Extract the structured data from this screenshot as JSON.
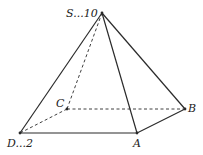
{
  "diagram": {
    "type": "square pyramid",
    "line_color": "#2a2a2a",
    "vertices": {
      "S": {
        "x": 102,
        "y": 13,
        "label": "S...10"
      },
      "A": {
        "x": 137,
        "y": 133,
        "label": "A"
      },
      "B": {
        "x": 185,
        "y": 109,
        "label": "B"
      },
      "C": {
        "x": 67,
        "y": 109,
        "label": "C"
      },
      "D": {
        "x": 20,
        "y": 133,
        "label": "D...2"
      }
    },
    "solid_edges": [
      [
        "S",
        "D"
      ],
      [
        "S",
        "A"
      ],
      [
        "S",
        "B"
      ],
      [
        "D",
        "A"
      ],
      [
        "A",
        "B"
      ]
    ],
    "dashed_edges": [
      [
        "S",
        "C"
      ],
      [
        "C",
        "B"
      ],
      [
        "C",
        "D"
      ]
    ]
  }
}
